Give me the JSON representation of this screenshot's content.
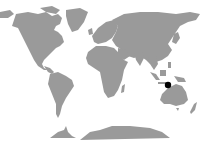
{
  "map": {
    "type": "world-locator",
    "projection": "equirectangular",
    "land_color": "#9a9a9a",
    "ocean_color": "#ffffff",
    "marker": {
      "label": "location-marker",
      "region": "Timor / eastern Indonesia",
      "x": 168,
      "y": 85,
      "radius": 3.2,
      "color": "#000000"
    }
  }
}
